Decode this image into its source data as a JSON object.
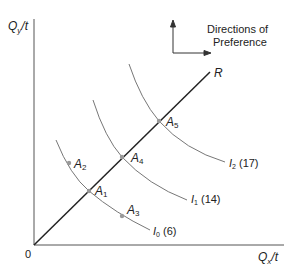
{
  "axes": {
    "y_label_main": "Q",
    "y_label_sub": "y",
    "y_label_tail": "/t",
    "x_label_main": "Q",
    "x_label_sub": "x",
    "x_label_tail": "/t",
    "origin": "0"
  },
  "legend": {
    "line1": "Directions of",
    "line2": "Preference"
  },
  "ray": {
    "label": "R"
  },
  "points": [
    {
      "main": "A",
      "sub": "1"
    },
    {
      "main": "A",
      "sub": "2"
    },
    {
      "main": "A",
      "sub": "3"
    },
    {
      "main": "A",
      "sub": "4"
    },
    {
      "main": "A",
      "sub": "5"
    }
  ],
  "curves": [
    {
      "main": "I",
      "sub": "0",
      "value": "(6)"
    },
    {
      "main": "I",
      "sub": "1",
      "value": "(14)"
    },
    {
      "main": "I",
      "sub": "2",
      "value": "(17)"
    }
  ],
  "colors": {
    "axis": "#555555",
    "ray": "#222222",
    "curve": "#777777",
    "point": "#999999"
  }
}
